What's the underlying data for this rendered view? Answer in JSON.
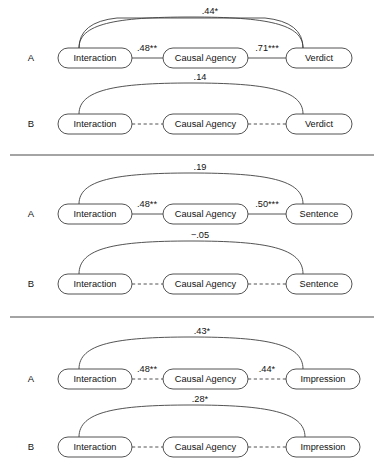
{
  "figure": {
    "type": "path-model-diagram",
    "width": 382,
    "height": 468,
    "background_color": "#ffffff",
    "line_color": "#3f3f3f",
    "text_color": "#111111"
  },
  "panels": [
    {
      "id": "panel-verdict",
      "rows": [
        {
          "letter": "A",
          "line_style": "solid",
          "nodes": [
            "Interaction",
            "Causal Agency",
            "Verdict"
          ],
          "path_labels": [
            ".48**",
            ".71***"
          ],
          "arc_label": ".44*"
        },
        {
          "letter": "B",
          "line_style": "dashed",
          "nodes": [
            "Interaction",
            "Causal Agency",
            "Verdict"
          ],
          "path_labels": [
            "",
            ""
          ],
          "arc_label": ".14"
        }
      ]
    },
    {
      "id": "panel-sentence",
      "rows": [
        {
          "letter": "A",
          "line_style": "solid",
          "nodes": [
            "Interaction",
            "Causal Agency",
            "Sentence"
          ],
          "path_labels": [
            ".48**",
            ".50***"
          ],
          "arc_label": ".19"
        },
        {
          "letter": "B",
          "line_style": "dashed",
          "nodes": [
            "Interaction",
            "Causal Agency",
            "Sentence"
          ],
          "path_labels": [
            "",
            ""
          ],
          "arc_label": "−.05"
        }
      ]
    },
    {
      "id": "panel-impression",
      "rows": [
        {
          "letter": "A",
          "line_style": "dashed",
          "nodes": [
            "Interaction",
            "Causal Agency",
            "Impression"
          ],
          "path_labels": [
            ".48**",
            ".44*"
          ],
          "arc_label": ".43*"
        },
        {
          "letter": "B",
          "line_style": "dashed",
          "nodes": [
            "Interaction",
            "Causal Agency",
            "Impression"
          ],
          "path_labels": [
            "",
            ""
          ],
          "arc_label": ".28*"
        }
      ]
    }
  ]
}
